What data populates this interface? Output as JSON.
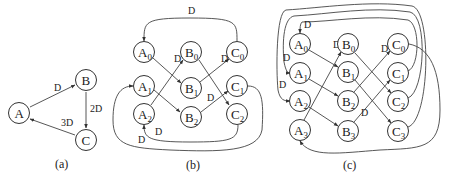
{
  "figure": {
    "panels": [
      {
        "id": "a",
        "caption": "(a)",
        "caption_pos": [
          63,
          164
        ],
        "nodes": [
          {
            "id": "A",
            "label": "A",
            "sub": "",
            "x": 19,
            "y": 113
          },
          {
            "id": "B",
            "label": "B",
            "sub": "",
            "x": 86,
            "y": 80
          },
          {
            "id": "C",
            "label": "C",
            "sub": "",
            "x": 86,
            "y": 140
          }
        ],
        "edges": [
          {
            "from": "A",
            "to": "B",
            "label": "D",
            "path": "M30,107 L75,85",
            "lx": 54,
            "ly": 91
          },
          {
            "from": "B",
            "to": "C",
            "label": "2D",
            "path": "M86,92 L86,128",
            "lx": 90,
            "ly": 112
          },
          {
            "from": "C",
            "to": "A",
            "label": "3D",
            "path": "M75,135 L30,119",
            "lx": 61,
            "ly": 126
          }
        ]
      },
      {
        "id": "b",
        "caption": "(b)",
        "caption_pos": [
          194,
          165
        ],
        "nodes": [
          {
            "id": "A0",
            "label": "A",
            "sub": "0",
            "x": 144,
            "y": 52
          },
          {
            "id": "B0",
            "label": "B",
            "sub": "0",
            "x": 191,
            "y": 52
          },
          {
            "id": "C0",
            "label": "C",
            "sub": "0",
            "x": 237,
            "y": 52
          },
          {
            "id": "A1",
            "label": "A",
            "sub": "1",
            "x": 144,
            "y": 86
          },
          {
            "id": "B1",
            "label": "B",
            "sub": "1",
            "x": 191,
            "y": 88
          },
          {
            "id": "C1",
            "label": "C",
            "sub": "1",
            "x": 237,
            "y": 86
          },
          {
            "id": "A2",
            "label": "A",
            "sub": "2",
            "x": 144,
            "y": 114
          },
          {
            "id": "B2",
            "label": "B",
            "sub": "2",
            "x": 191,
            "y": 117
          },
          {
            "id": "C2",
            "label": "C",
            "sub": "2",
            "x": 237,
            "y": 114
          }
        ],
        "edges": [
          {
            "from": "C0",
            "to": "A0",
            "label": "D",
            "path": "M237,41 C237,22 237,18 190,18 C144,18 144,22 144,41",
            "lx": 188,
            "ly": 14
          },
          {
            "from": "A0",
            "to": "B1",
            "label": "",
            "path": "M153,58 L181,83",
            "lx": 0,
            "ly": 0
          },
          {
            "from": "A2",
            "to": "B0",
            "label": "D",
            "path": "M151,105 L183,60",
            "lx": 174,
            "ly": 62
          },
          {
            "from": "B0",
            "to": "C2",
            "label": "",
            "path": "M199,60 L229,105",
            "lx": 0,
            "ly": 0
          },
          {
            "from": "B1",
            "to": "C0",
            "label": "D",
            "path": "M200,82 L229,59",
            "lx": 221,
            "ly": 62
          },
          {
            "from": "A1",
            "to": "B2",
            "label": "",
            "path": "M154,90 L180,112",
            "lx": 0,
            "ly": 0
          },
          {
            "from": "B2",
            "to": "C1",
            "label": "D",
            "path": "M201,112 L228,91",
            "lx": 207,
            "ly": 101
          },
          {
            "from": "C2",
            "to": "A2",
            "label": "D",
            "path": "M238,125 C238,140 230,142 190,142 C148,142 144,138 144,125",
            "lx": 155,
            "ly": 135
          },
          {
            "from": "C1",
            "to": "A1",
            "label": "D",
            "path": "M248,86 C262,86 264,100 262,130 C258,152 220,152 170,150 C130,148 113,146 113,120 C113,96 120,86 133,86",
            "lx": 138,
            "ly": 143
          }
        ]
      },
      {
        "id": "c",
        "caption": "(c)",
        "caption_pos": [
          351,
          165
        ],
        "nodes": [
          {
            "id": "A0",
            "label": "A",
            "sub": "0",
            "x": 300,
            "y": 44
          },
          {
            "id": "B0",
            "label": "B",
            "sub": "0",
            "x": 348,
            "y": 44
          },
          {
            "id": "C0",
            "label": "C",
            "sub": "0",
            "x": 398,
            "y": 44
          },
          {
            "id": "A1",
            "label": "A",
            "sub": "1",
            "x": 300,
            "y": 73
          },
          {
            "id": "B1",
            "label": "B",
            "sub": "1",
            "x": 348,
            "y": 72
          },
          {
            "id": "C1",
            "label": "C",
            "sub": "1",
            "x": 398,
            "y": 73
          },
          {
            "id": "A2",
            "label": "A",
            "sub": "2",
            "x": 300,
            "y": 101
          },
          {
            "id": "B2",
            "label": "B",
            "sub": "2",
            "x": 348,
            "y": 101
          },
          {
            "id": "C2",
            "label": "C",
            "sub": "2",
            "x": 398,
            "y": 101
          },
          {
            "id": "A3",
            "label": "A",
            "sub": "3",
            "x": 300,
            "y": 130
          },
          {
            "id": "B3",
            "label": "B",
            "sub": "3",
            "x": 348,
            "y": 131
          },
          {
            "id": "C3",
            "label": "C",
            "sub": "3",
            "x": 398,
            "y": 131
          }
        ],
        "edges": [
          {
            "from": "A0",
            "to": "B1",
            "label": "",
            "path": "M309,50 L338,67",
            "lx": 0,
            "ly": 0
          },
          {
            "from": "A1",
            "to": "B2",
            "label": "",
            "path": "M309,79 L338,96",
            "lx": 0,
            "ly": 0
          },
          {
            "from": "A2",
            "to": "B3",
            "label": "",
            "path": "M309,107 L338,126",
            "lx": 0,
            "ly": 0
          },
          {
            "from": "A3",
            "to": "B0",
            "label": "D",
            "path": "M304,120 L341,52",
            "lx": 333,
            "ly": 48
          },
          {
            "from": "B0",
            "to": "C2",
            "label": "",
            "path": "M355,53 L391,93",
            "lx": 0,
            "ly": 0
          },
          {
            "from": "B1",
            "to": "C3",
            "label": "",
            "path": "M355,80 L391,123",
            "lx": 0,
            "ly": 0
          },
          {
            "from": "B2",
            "to": "C0",
            "label": "D",
            "path": "M354,92 L390,51",
            "lx": 381,
            "ly": 52
          },
          {
            "from": "B3",
            "to": "C1",
            "label": "D",
            "path": "M354,122 L390,80",
            "lx": 361,
            "ly": 116
          },
          {
            "from": "C1",
            "to": "A0",
            "label": "D",
            "path": "M408,71 C420,66 420,24 408,20 C370,14 330,22 302,22 C300,24 300,28 300,33",
            "lx": 304,
            "ly": 28
          },
          {
            "from": "C2",
            "to": "A1",
            "label": "D",
            "path": "M408,98 C425,92 428,16 410,12 C370,6 330,14 294,16 C284,18 282,40 284,62 C286,72 288,73 290,73",
            "lx": 283,
            "ly": 61
          },
          {
            "from": "C3",
            "to": "A2",
            "label": "D",
            "path": "M408,127 C430,120 432,10 412,6 C370,0 320,8 286,10 C276,12 276,70 278,90 C280,100 284,101 290,101",
            "lx": 279,
            "ly": 88
          },
          {
            "from": "C0",
            "to": "A3",
            "label": "",
            "path": "M409,44 C430,48 440,70 440,110 C440,150 420,148 380,150 C340,153 310,158 300,141",
            "lx": 0,
            "ly": 0
          }
        ]
      }
    ]
  }
}
